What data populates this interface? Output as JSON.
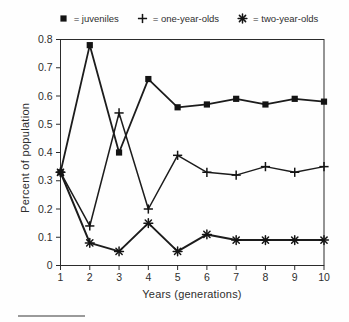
{
  "legend": {
    "items": [
      {
        "marker": "square",
        "label": "= juveniles"
      },
      {
        "marker": "plus",
        "label": "= one-year-olds"
      },
      {
        "marker": "asterisk",
        "label": "= two-year-olds"
      }
    ]
  },
  "axes": {
    "y_label": "Percent of population",
    "x_label": "Years (generations)"
  },
  "chart_data": {
    "type": "line",
    "title": "",
    "xlabel": "Years (generations)",
    "ylabel": "Percent of population",
    "x": [
      1,
      2,
      3,
      4,
      5,
      6,
      7,
      8,
      9,
      10
    ],
    "x_tick_labels": [
      "1",
      "2",
      "3",
      "4",
      "5",
      "6",
      "7",
      "8",
      "9",
      "10"
    ],
    "y_ticks": [
      0,
      0.1,
      0.2,
      0.3,
      0.4,
      0.5,
      0.6,
      0.7,
      0.8
    ],
    "y_tick_labels": [
      "0",
      "0.1",
      "0.2",
      "0.3",
      "0.4",
      "0.5",
      "0.6",
      "0.7",
      "0.8"
    ],
    "xlim": [
      1,
      10
    ],
    "ylim": [
      0,
      0.8
    ],
    "grid": false,
    "legend_position": "top",
    "axis_color": "#2b2b2b",
    "line_color": "#1c1c1c",
    "marker_color": "#141414",
    "series": [
      {
        "name": "juveniles",
        "marker": "square",
        "line_width": 1.8,
        "values": [
          0.33,
          0.78,
          0.4,
          0.66,
          0.56,
          0.57,
          0.59,
          0.57,
          0.59,
          0.58
        ]
      },
      {
        "name": "one-year-olds",
        "marker": "plus",
        "line_width": 1.5,
        "values": [
          0.33,
          0.14,
          0.54,
          0.2,
          0.39,
          0.33,
          0.32,
          0.35,
          0.33,
          0.35
        ]
      },
      {
        "name": "two-year-olds",
        "marker": "asterisk",
        "line_width": 2.0,
        "values": [
          0.33,
          0.08,
          0.05,
          0.15,
          0.05,
          0.11,
          0.09,
          0.09,
          0.09,
          0.09
        ]
      }
    ]
  }
}
